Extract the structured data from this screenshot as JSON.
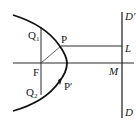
{
  "diagram": {
    "labels": {
      "Q1": "Q",
      "Q1_sub": "1",
      "Q2": "Q",
      "Q2_sub": "2",
      "P": "P",
      "P_prime": "P′",
      "F": "F",
      "L": "L",
      "M": "M",
      "D_prime": "D′",
      "D": "D"
    },
    "colors": {
      "ink": "#1a1a1a",
      "background": "#ffffff"
    }
  }
}
